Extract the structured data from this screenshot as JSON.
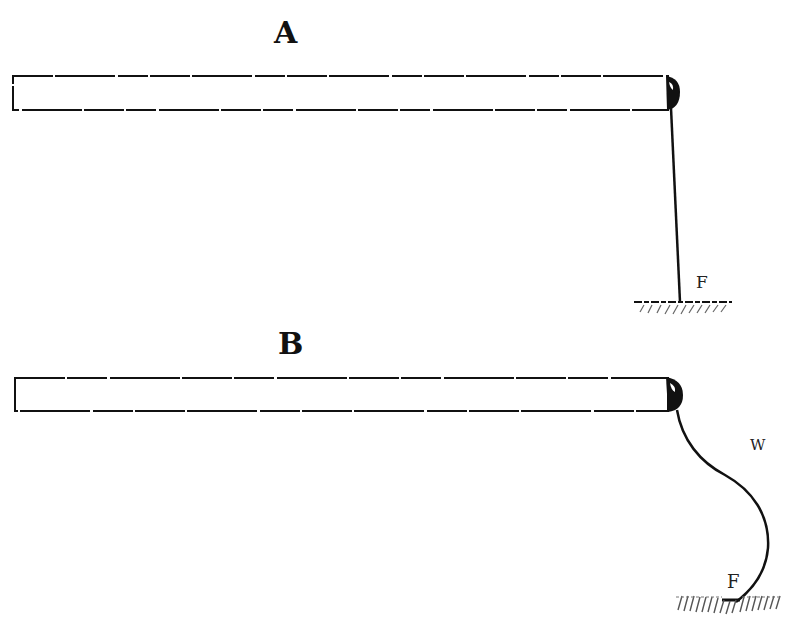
{
  "figure": {
    "panels": [
      {
        "id": "A",
        "title": "A",
        "rod": {
          "x": 13,
          "y": 76,
          "width": 655,
          "height": 34
        },
        "thread": {
          "shape": "straight",
          "label": "F"
        },
        "ground_label": "F"
      },
      {
        "id": "B",
        "title": "B",
        "rod": {
          "x": 15,
          "y": 378,
          "width": 653,
          "height": 33
        },
        "thread": {
          "shape": "curved",
          "label": "W"
        },
        "ground_label": "F"
      }
    ],
    "labels": {
      "panel_a": "A",
      "panel_b": "B",
      "a_fixed_point": "F",
      "b_wire": "W",
      "b_fixed_point": "F"
    },
    "colors": {
      "ink": "#111111",
      "hatch": "#555555",
      "background": "#ffffff"
    }
  }
}
